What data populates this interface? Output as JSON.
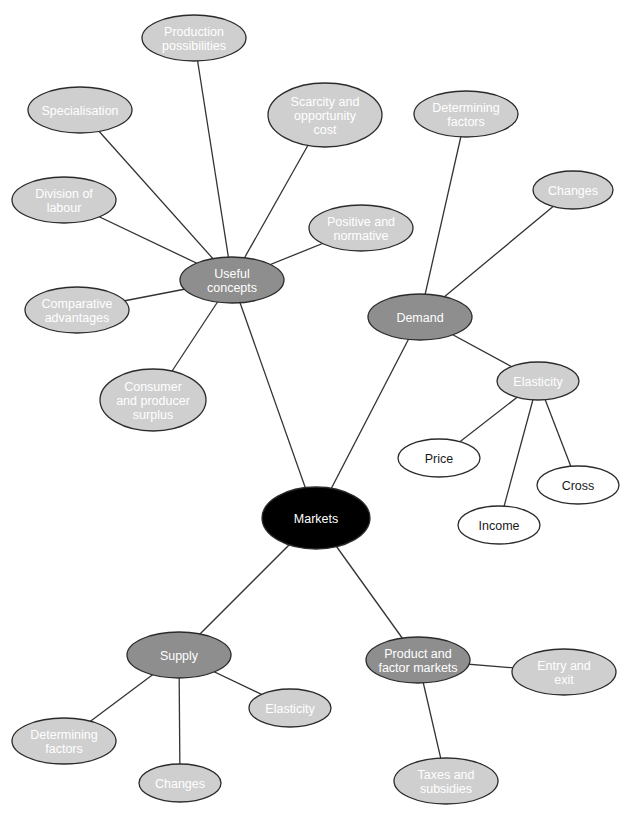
{
  "diagram": {
    "type": "mind-map",
    "root": "markets",
    "colors": {
      "root_fill": "#000000",
      "root_text": "#ffffff",
      "primary_fill": "#8e8e8e",
      "primary_text": "#ffffff",
      "secondary_fill": "#cfcfcf",
      "secondary_text": "#ffffff",
      "tertiary_fill": "#ffffff",
      "tertiary_text": "#1a1a1a",
      "stroke": "#2b2b2b"
    },
    "nodes": [
      {
        "id": "markets",
        "level": "root",
        "lines": [
          "Markets"
        ],
        "cx": 316,
        "cy": 518,
        "rx": 54,
        "ry": 31
      },
      {
        "id": "useful-concepts",
        "level": "primary",
        "lines": [
          "Useful",
          "concepts"
        ],
        "cx": 232,
        "cy": 280,
        "rx": 52,
        "ry": 23
      },
      {
        "id": "demand",
        "level": "primary",
        "lines": [
          "Demand"
        ],
        "cx": 420,
        "cy": 317,
        "rx": 52,
        "ry": 23
      },
      {
        "id": "supply",
        "level": "primary",
        "lines": [
          "Supply"
        ],
        "cx": 179,
        "cy": 655,
        "rx": 52,
        "ry": 23
      },
      {
        "id": "product-and-factor-markets",
        "level": "primary",
        "lines": [
          "Product and",
          "factor markets"
        ],
        "cx": 418,
        "cy": 660,
        "rx": 52,
        "ry": 23
      },
      {
        "id": "production-possibilities",
        "level": "secondary",
        "lines": [
          "Production",
          "possibilities"
        ],
        "cx": 194,
        "cy": 38,
        "rx": 52,
        "ry": 23
      },
      {
        "id": "specialisation",
        "level": "secondary",
        "lines": [
          "Specialisation"
        ],
        "cx": 80,
        "cy": 110,
        "rx": 52,
        "ry": 23
      },
      {
        "id": "scarcity-and-opportunity-cost",
        "level": "secondary",
        "lines": [
          "Scarcity and",
          "opportunity",
          "cost"
        ],
        "cx": 325,
        "cy": 115,
        "rx": 57,
        "ry": 32
      },
      {
        "id": "division-of-labour",
        "level": "secondary",
        "lines": [
          "Division of",
          "labour"
        ],
        "cx": 64,
        "cy": 200,
        "rx": 52,
        "ry": 23
      },
      {
        "id": "positive-and-normative",
        "level": "secondary",
        "lines": [
          "Positive and",
          "normative"
        ],
        "cx": 361,
        "cy": 228,
        "rx": 52,
        "ry": 23
      },
      {
        "id": "comparative-advantages",
        "level": "secondary",
        "lines": [
          "Comparative",
          "advantages"
        ],
        "cx": 77,
        "cy": 310,
        "rx": 52,
        "ry": 23
      },
      {
        "id": "consumer-and-producer-surplus",
        "level": "secondary",
        "lines": [
          "Consumer",
          "and producer",
          "surplus"
        ],
        "cx": 153,
        "cy": 400,
        "rx": 53,
        "ry": 31
      },
      {
        "id": "demand-determining-factors",
        "level": "secondary",
        "lines": [
          "Determining",
          "factors"
        ],
        "cx": 466,
        "cy": 114,
        "rx": 52,
        "ry": 23
      },
      {
        "id": "demand-changes",
        "level": "secondary",
        "lines": [
          "Changes"
        ],
        "cx": 573,
        "cy": 190,
        "rx": 40,
        "ry": 19
      },
      {
        "id": "demand-elasticity",
        "level": "secondary",
        "lines": [
          "Elasticity"
        ],
        "cx": 538,
        "cy": 381,
        "rx": 41,
        "ry": 19
      },
      {
        "id": "price",
        "level": "tertiary",
        "lines": [
          "Price"
        ],
        "cx": 439,
        "cy": 458,
        "rx": 41,
        "ry": 19
      },
      {
        "id": "cross",
        "level": "tertiary",
        "lines": [
          "Cross"
        ],
        "cx": 578,
        "cy": 485,
        "rx": 41,
        "ry": 19
      },
      {
        "id": "income",
        "level": "tertiary",
        "lines": [
          "Income"
        ],
        "cx": 499,
        "cy": 525,
        "rx": 41,
        "ry": 19
      },
      {
        "id": "supply-elasticity",
        "level": "secondary",
        "lines": [
          "Elasticity"
        ],
        "cx": 290,
        "cy": 708,
        "rx": 41,
        "ry": 19
      },
      {
        "id": "supply-determining-factors",
        "level": "secondary",
        "lines": [
          "Determining",
          "factors"
        ],
        "cx": 64,
        "cy": 741,
        "rx": 52,
        "ry": 23
      },
      {
        "id": "supply-changes",
        "level": "secondary",
        "lines": [
          "Changes"
        ],
        "cx": 180,
        "cy": 783,
        "rx": 41,
        "ry": 19
      },
      {
        "id": "entry-and-exit",
        "level": "secondary",
        "lines": [
          "Entry and",
          "exit"
        ],
        "cx": 564,
        "cy": 672,
        "rx": 52,
        "ry": 23
      },
      {
        "id": "taxes-and-subsidies",
        "level": "secondary",
        "lines": [
          "Taxes and",
          "subsidies"
        ],
        "cx": 446,
        "cy": 781,
        "rx": 52,
        "ry": 23
      }
    ],
    "edges": [
      {
        "from": "markets",
        "to": "useful-concepts"
      },
      {
        "from": "markets",
        "to": "demand"
      },
      {
        "from": "markets",
        "to": "supply"
      },
      {
        "from": "markets",
        "to": "product-and-factor-markets"
      },
      {
        "from": "useful-concepts",
        "to": "production-possibilities"
      },
      {
        "from": "useful-concepts",
        "to": "specialisation"
      },
      {
        "from": "useful-concepts",
        "to": "scarcity-and-opportunity-cost"
      },
      {
        "from": "useful-concepts",
        "to": "division-of-labour"
      },
      {
        "from": "useful-concepts",
        "to": "positive-and-normative"
      },
      {
        "from": "useful-concepts",
        "to": "comparative-advantages"
      },
      {
        "from": "useful-concepts",
        "to": "consumer-and-producer-surplus"
      },
      {
        "from": "demand",
        "to": "demand-determining-factors"
      },
      {
        "from": "demand",
        "to": "demand-changes"
      },
      {
        "from": "demand",
        "to": "demand-elasticity"
      },
      {
        "from": "demand-elasticity",
        "to": "price"
      },
      {
        "from": "demand-elasticity",
        "to": "income"
      },
      {
        "from": "demand-elasticity",
        "to": "cross"
      },
      {
        "from": "supply",
        "to": "supply-determining-factors"
      },
      {
        "from": "supply",
        "to": "supply-changes"
      },
      {
        "from": "supply",
        "to": "supply-elasticity"
      },
      {
        "from": "product-and-factor-markets",
        "to": "entry-and-exit"
      },
      {
        "from": "product-and-factor-markets",
        "to": "taxes-and-subsidies"
      }
    ]
  }
}
